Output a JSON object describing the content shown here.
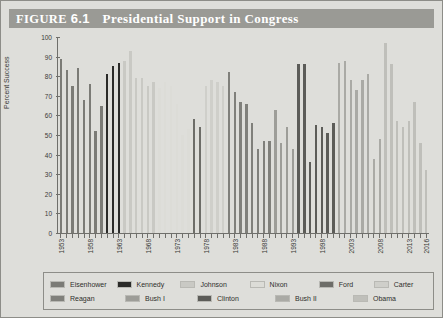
{
  "figure": {
    "label": "FIGURE",
    "number": "6.1",
    "title": "Presidential Support in Congress"
  },
  "chart_data": {
    "type": "bar",
    "title": "Presidential Support in Congress",
    "xlabel": "",
    "ylabel": "Percent Success",
    "ylim": [
      0,
      100
    ],
    "ytick_values": [
      0,
      10,
      20,
      30,
      40,
      50,
      60,
      70,
      80,
      90,
      100
    ],
    "ytick_labels": [
      "0",
      "10",
      "20",
      "30",
      "40",
      "50",
      "60",
      "70",
      "80",
      "90",
      "100"
    ],
    "xtick_labels": [
      "1953",
      "1958",
      "1963",
      "1968",
      "1973",
      "1978",
      "1983",
      "1988",
      "1993",
      "1998",
      "2003",
      "2008",
      "2013",
      "2016"
    ],
    "grid": false,
    "legend_position": "below-plot",
    "colors": {
      "Eisenhower": "#7b7b76",
      "Kennedy": "#2a2a28",
      "Johnson": "#c9c9c4",
      "Nixon": "#dcdcd7",
      "Ford": "#6d6d68",
      "Carter": "#cfcfca",
      "Reagan": "#80807b",
      "Bush I": "#9d9d98",
      "Clinton": "#5c5c58",
      "Bush II": "#aaaaa5",
      "Obama": "#bfbfba"
    },
    "series": [
      {
        "name": "Eisenhower",
        "values": [
          89,
          83,
          75,
          84,
          68,
          76,
          52,
          65
        ]
      },
      {
        "name": "Kennedy",
        "values": [
          81,
          85,
          87
        ]
      },
      {
        "name": "Johnson",
        "values": [
          88,
          93,
          79,
          79,
          75,
          77
        ]
      },
      {
        "name": "Nixon",
        "values": [
          74,
          77,
          75,
          66,
          50,
          53
        ]
      },
      {
        "name": "Ford",
        "values": [
          58,
          54
        ]
      },
      {
        "name": "Carter",
        "values": [
          75,
          78,
          77,
          75
        ]
      },
      {
        "name": "Reagan",
        "values": [
          82,
          72,
          67,
          66,
          56,
          43,
          47,
          47
        ]
      },
      {
        "name": "Bush I",
        "values": [
          63,
          46,
          54,
          43
        ]
      },
      {
        "name": "Clinton",
        "values": [
          86,
          86,
          36,
          55,
          54,
          51,
          56
        ]
      },
      {
        "name": "Bush II",
        "values": [
          87,
          88,
          78,
          73,
          78,
          81,
          38,
          48
        ]
      },
      {
        "name": "Obama",
        "values": [
          97,
          86,
          57,
          54,
          57,
          67,
          46,
          32
        ]
      }
    ],
    "x_start_year": 1953,
    "x_end_year": 2016,
    "bars": [
      {
        "year": "1953",
        "value": 89,
        "president": "Eisenhower"
      },
      {
        "year": "1954",
        "value": 83,
        "president": "Eisenhower"
      },
      {
        "year": "1955",
        "value": 75,
        "president": "Eisenhower"
      },
      {
        "year": "1956",
        "value": 84,
        "president": "Eisenhower"
      },
      {
        "year": "1957",
        "value": 68,
        "president": "Eisenhower"
      },
      {
        "year": "1958",
        "value": 76,
        "president": "Eisenhower"
      },
      {
        "year": "1959",
        "value": 52,
        "president": "Eisenhower"
      },
      {
        "year": "1960",
        "value": 65,
        "president": "Eisenhower"
      },
      {
        "year": "1961",
        "value": 81,
        "president": "Kennedy"
      },
      {
        "year": "1962",
        "value": 85,
        "president": "Kennedy"
      },
      {
        "year": "1963",
        "value": 87,
        "president": "Kennedy"
      },
      {
        "year": "1964",
        "value": 88,
        "president": "Johnson"
      },
      {
        "year": "1965",
        "value": 93,
        "president": "Johnson"
      },
      {
        "year": "1966",
        "value": 79,
        "president": "Johnson"
      },
      {
        "year": "1967",
        "value": 79,
        "president": "Johnson"
      },
      {
        "year": "1968",
        "value": 75,
        "president": "Johnson"
      },
      {
        "year": "1969",
        "value": 77,
        "president": "Johnson"
      },
      {
        "year": "1970",
        "value": 74,
        "president": "Nixon"
      },
      {
        "year": "1971",
        "value": 77,
        "president": "Nixon"
      },
      {
        "year": "1972",
        "value": 75,
        "president": "Nixon"
      },
      {
        "year": "1973",
        "value": 66,
        "president": "Nixon"
      },
      {
        "year": "1974",
        "value": 50,
        "president": "Nixon"
      },
      {
        "year": "1975",
        "value": 53,
        "president": "Nixon"
      },
      {
        "year": "1976",
        "value": 58,
        "president": "Ford"
      },
      {
        "year": "1977",
        "value": 54,
        "president": "Ford"
      },
      {
        "year": "1978",
        "value": 75,
        "president": "Carter"
      },
      {
        "year": "1979",
        "value": 78,
        "president": "Carter"
      },
      {
        "year": "1980",
        "value": 77,
        "president": "Carter"
      },
      {
        "year": "1981",
        "value": 75,
        "president": "Carter"
      },
      {
        "year": "1982",
        "value": 82,
        "president": "Reagan"
      },
      {
        "year": "1983",
        "value": 72,
        "president": "Reagan"
      },
      {
        "year": "1984",
        "value": 67,
        "president": "Reagan"
      },
      {
        "year": "1985",
        "value": 66,
        "president": "Reagan"
      },
      {
        "year": "1986",
        "value": 56,
        "president": "Reagan"
      },
      {
        "year": "1987",
        "value": 43,
        "president": "Reagan"
      },
      {
        "year": "1988",
        "value": 47,
        "president": "Reagan"
      },
      {
        "year": "1989",
        "value": 47,
        "president": "Reagan"
      },
      {
        "year": "1990",
        "value": 63,
        "president": "Bush I"
      },
      {
        "year": "1991",
        "value": 46,
        "president": "Bush I"
      },
      {
        "year": "1992",
        "value": 54,
        "president": "Bush I"
      },
      {
        "year": "1993",
        "value": 43,
        "president": "Bush I"
      },
      {
        "year": "1994",
        "value": 86,
        "president": "Clinton"
      },
      {
        "year": "1995",
        "value": 86,
        "president": "Clinton"
      },
      {
        "year": "1996",
        "value": 36,
        "president": "Clinton"
      },
      {
        "year": "1997",
        "value": 55,
        "president": "Clinton"
      },
      {
        "year": "1998",
        "value": 54,
        "president": "Clinton"
      },
      {
        "year": "1999",
        "value": 51,
        "president": "Clinton"
      },
      {
        "year": "2000",
        "value": 56,
        "president": "Clinton"
      },
      {
        "year": "2001",
        "value": 87,
        "president": "Bush II"
      },
      {
        "year": "2002",
        "value": 88,
        "president": "Bush II"
      },
      {
        "year": "2003",
        "value": 78,
        "president": "Bush II"
      },
      {
        "year": "2004",
        "value": 73,
        "president": "Bush II"
      },
      {
        "year": "2005",
        "value": 78,
        "president": "Bush II"
      },
      {
        "year": "2006",
        "value": 81,
        "president": "Bush II"
      },
      {
        "year": "2007",
        "value": 38,
        "president": "Bush II"
      },
      {
        "year": "2008",
        "value": 48,
        "president": "Bush II"
      },
      {
        "year": "2009",
        "value": 97,
        "president": "Obama"
      },
      {
        "year": "2010",
        "value": 86,
        "president": "Obama"
      },
      {
        "year": "2011",
        "value": 57,
        "president": "Obama"
      },
      {
        "year": "2012",
        "value": 54,
        "president": "Obama"
      },
      {
        "year": "2013",
        "value": 57,
        "president": "Obama"
      },
      {
        "year": "2014",
        "value": 67,
        "president": "Obama"
      },
      {
        "year": "2015",
        "value": 46,
        "president": "Obama"
      },
      {
        "year": "2016",
        "value": 32,
        "president": "Obama"
      }
    ],
    "legend": {
      "row1": [
        {
          "label": "Eisenhower",
          "color": "#7b7b76"
        },
        {
          "label": "Kennedy",
          "color": "#2a2a28"
        },
        {
          "label": "Johnson",
          "color": "#c9c9c4"
        },
        {
          "label": "Nixon",
          "color": "#dcdcd7"
        },
        {
          "label": "Ford",
          "color": "#6d6d68"
        },
        {
          "label": "Carter",
          "color": "#cfcfca"
        }
      ],
      "row2": [
        {
          "label": "Reagan",
          "color": "#80807b"
        },
        {
          "label": "Bush I",
          "color": "#9d9d98"
        },
        {
          "label": "Clinton",
          "color": "#5c5c58"
        },
        {
          "label": "Bush II",
          "color": "#aaaaa5"
        },
        {
          "label": "Obama",
          "color": "#bfbfba"
        }
      ]
    }
  }
}
